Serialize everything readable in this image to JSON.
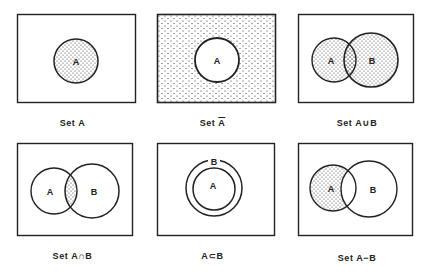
{
  "figure": {
    "colors": {
      "stroke": "#222222",
      "background": "#ffffff",
      "dots": "#333333"
    },
    "panels": [
      {
        "id": "set-a",
        "caption_prefix": "Set ",
        "caption_main": "A",
        "caption_overbar": false,
        "circle_labels": [
          "A"
        ],
        "shaded": "A"
      },
      {
        "id": "set-a-complement",
        "caption_prefix": "Set ",
        "caption_main": "A",
        "caption_overbar": true,
        "circle_labels": [
          "A"
        ],
        "shaded": "universe minus A"
      },
      {
        "id": "set-a-union-b",
        "caption_prefix": "Set ",
        "caption_main": "A∪B",
        "caption_overbar": false,
        "circle_labels": [
          "A",
          "B"
        ],
        "shaded": "A union B"
      },
      {
        "id": "set-a-intersect-b",
        "caption_prefix": "Set ",
        "caption_main": "A∩B",
        "caption_overbar": false,
        "circle_labels": [
          "A",
          "B"
        ],
        "shaded": "A intersect B"
      },
      {
        "id": "a-subset-b",
        "caption_prefix": "",
        "caption_main": "A⊂B",
        "caption_overbar": false,
        "circle_labels": [
          "A",
          "B"
        ],
        "shaded": "none"
      },
      {
        "id": "set-a-minus-b",
        "caption_prefix": "Set ",
        "caption_main": "A−B",
        "caption_overbar": false,
        "circle_labels": [
          "A",
          "B"
        ],
        "shaded": "A minus B"
      }
    ]
  }
}
